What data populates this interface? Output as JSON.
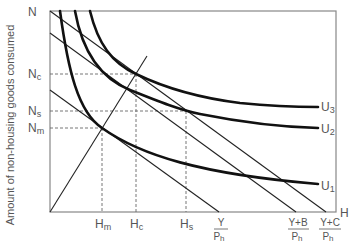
{
  "diagram": {
    "type": "indifference-curve / budget-line diagram",
    "y_axis": {
      "label": "Amount of non-housing goods consumed",
      "end_label": "N"
    },
    "x_axis": {
      "end_label": "H"
    },
    "y_ticks": [
      {
        "main": "N",
        "sub": "c",
        "y": 74
      },
      {
        "main": "N",
        "sub": "s",
        "y": 111
      },
      {
        "main": "N",
        "sub": "m",
        "y": 128
      }
    ],
    "x_ticks": [
      {
        "main": "H",
        "sub": "m",
        "x": 102
      },
      {
        "main": "H",
        "sub": "c",
        "x": 136
      },
      {
        "main": "H",
        "sub": "s",
        "x": 186
      }
    ],
    "budget_intercepts": [
      {
        "numerator": "Y",
        "denominator_main": "P",
        "denominator_sub": "h",
        "x": 219
      },
      {
        "numerator": "Y+B",
        "denominator_main": "P",
        "denominator_sub": "h",
        "x": 296
      },
      {
        "numerator": "Y+C",
        "denominator_main": "P",
        "denominator_sub": "h",
        "x": 326
      }
    ],
    "curves": [
      {
        "main": "U",
        "sub": "1"
      },
      {
        "main": "U",
        "sub": "2"
      },
      {
        "main": "U",
        "sub": "3"
      }
    ]
  }
}
